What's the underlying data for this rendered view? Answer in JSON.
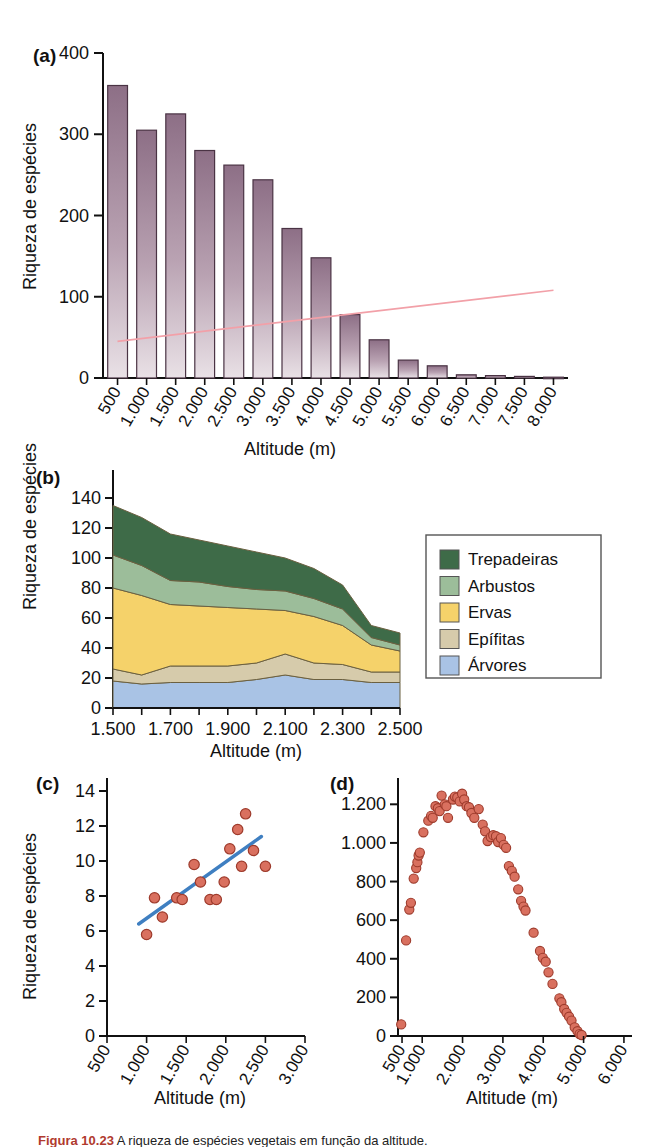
{
  "figure": {
    "caption_label": "Figura 10.23",
    "caption_text": "   A riqueza de espécies vegetais em função da altitude.",
    "shared_y_label": "Riqueza de espécies",
    "shared_x_label": "Altitude (m)"
  },
  "panels": {
    "a": {
      "tag": "(a)",
      "ylabel": "Riqueza de espécies",
      "xlabel": "Altitude (m)",
      "ylim": [
        0,
        400
      ],
      "yticks": [
        "0",
        "100",
        "200",
        "300",
        "400"
      ]
    },
    "b": {
      "tag": "(b)",
      "ylabel": "Riqueza de espécies",
      "xlabel": "Altitude (m)",
      "ylim": [
        0,
        140
      ],
      "yticks": [
        "0",
        "20",
        "40",
        "60",
        "80",
        "100",
        "120",
        "140"
      ]
    },
    "c": {
      "tag": "(c)",
      "ylabel": "Riqueza de espécies",
      "xlabel": "Altitude (m)",
      "ylim": [
        0,
        14
      ],
      "yticks": [
        "0",
        "2",
        "4",
        "6",
        "8",
        "10",
        "12",
        "14"
      ]
    },
    "d": {
      "tag": "(d)",
      "ylabel": "",
      "xlabel": "Altitude (m)",
      "ylim": [
        0,
        1300
      ],
      "yticks": [
        "0",
        "200",
        "400",
        "600",
        "800",
        "1.000",
        "1.200"
      ]
    }
  },
  "colors": {
    "bar_top": "#8d6f86",
    "bar_bottom": "#e6dde3",
    "bar_stroke": "#4a3344",
    "trend_pink": "#f2a0a8",
    "trend_blue": "#3f7fc1",
    "point_fill": "#d9705f",
    "point_stroke": "#9e3b2c",
    "trepadeiras": "#3e6b48",
    "arbustos": "#9cbd9a",
    "ervas": "#f5d26a",
    "epifitas": "#d6cbab",
    "arvores": "#a9c3e5",
    "axis": "#111111"
  },
  "chart_data": [
    {
      "id": "a",
      "type": "bar",
      "title": "(a)",
      "xlabel": "Altitude (m)",
      "ylabel": "Riqueza de espécies",
      "ylim": [
        0,
        400
      ],
      "yticks": [
        0,
        100,
        200,
        300,
        400
      ],
      "grid": false,
      "categories": [
        "500",
        "1.000",
        "1.500",
        "2.000",
        "2.500",
        "3.000",
        "3.500",
        "4.000",
        "4.500",
        "5.000",
        "5.500",
        "6.000",
        "6.500",
        "7.000",
        "7.500",
        "8.000"
      ],
      "values": [
        360,
        305,
        325,
        280,
        262,
        244,
        184,
        148,
        78,
        47,
        22,
        15,
        4,
        3,
        2,
        1
      ],
      "annotations": [
        {
          "type": "trend-line",
          "color": "#f2a0a8",
          "from": [
            0,
            45
          ],
          "to": [
            15,
            108
          ],
          "note": "faint pink regression line across bars"
        }
      ]
    },
    {
      "id": "b",
      "type": "area",
      "title": "(b)",
      "xlabel": "Altitude (m)",
      "ylabel": "Riqueza de espécies",
      "ylim": [
        0,
        140
      ],
      "yticks": [
        0,
        20,
        40,
        60,
        80,
        100,
        120,
        140
      ],
      "xticks": [
        "1.500",
        "1.700",
        "1.900",
        "2.100",
        "2.300",
        "2.500"
      ],
      "x": [
        1500,
        1600,
        1700,
        1800,
        1900,
        2000,
        2100,
        2200,
        2300,
        2400,
        2500
      ],
      "stacked": true,
      "legend_position": "right",
      "series": [
        {
          "name": "Árvores",
          "color": "#a9c3e5",
          "values": [
            18,
            16,
            17,
            17,
            17,
            19,
            22,
            19,
            19,
            17,
            17
          ]
        },
        {
          "name": "Epífitas",
          "color": "#d6cbab",
          "values": [
            8,
            6,
            11,
            11,
            11,
            11,
            14,
            11,
            10,
            7,
            7
          ]
        },
        {
          "name": "Ervas",
          "color": "#f5d26a",
          "values": [
            54,
            53,
            41,
            40,
            39,
            36,
            29,
            31,
            26,
            18,
            14
          ]
        },
        {
          "name": "Arbustos",
          "color": "#9cbd9a",
          "values": [
            22,
            20,
            16,
            16,
            14,
            13,
            13,
            12,
            11,
            5,
            4
          ]
        },
        {
          "name": "Trepadeiras",
          "color": "#3e6b48",
          "values": [
            33,
            32,
            31,
            28,
            27,
            25,
            22,
            20,
            16,
            8,
            8
          ]
        }
      ],
      "legend": [
        "Trepadeiras",
        "Arbustos",
        "Ervas",
        "Epífitas",
        "Árvores"
      ]
    },
    {
      "id": "c",
      "type": "scatter",
      "title": "(c)",
      "xlabel": "Altitude (m)",
      "ylabel": "Riqueza de espécies",
      "ylim": [
        0,
        14
      ],
      "yticks": [
        0,
        2,
        4,
        6,
        8,
        10,
        12,
        14
      ],
      "xlim": [
        500,
        3000
      ],
      "xticks": [
        "500",
        "1.000",
        "1.500",
        "2.000",
        "2.500",
        "3.000"
      ],
      "points": [
        [
          1000,
          5.8
        ],
        [
          1100,
          7.9
        ],
        [
          1200,
          6.8
        ],
        [
          1380,
          7.9
        ],
        [
          1450,
          7.8
        ],
        [
          1600,
          9.8
        ],
        [
          1680,
          8.8
        ],
        [
          1800,
          7.8
        ],
        [
          1880,
          7.8
        ],
        [
          1980,
          8.8
        ],
        [
          2050,
          10.7
        ],
        [
          2150,
          11.8
        ],
        [
          2250,
          12.7
        ],
        [
          2200,
          9.7
        ],
        [
          2350,
          10.6
        ],
        [
          2500,
          9.7
        ]
      ],
      "trend_line": {
        "color": "#3f7fc1",
        "from": [
          900,
          6.4
        ],
        "to": [
          2450,
          11.4
        ]
      }
    },
    {
      "id": "d",
      "type": "scatter",
      "title": "(d)",
      "xlabel": "Altitude (m)",
      "ylabel": "",
      "ylim": [
        0,
        1300
      ],
      "yticks": [
        0,
        200,
        400,
        600,
        800,
        1000,
        1200
      ],
      "xlim": [
        400,
        6200
      ],
      "xticks": [
        "500",
        "1.000",
        "2.000",
        "3.000",
        "4.000",
        "5.000",
        "6.000"
      ],
      "points": [
        [
          480,
          60
        ],
        [
          600,
          495
        ],
        [
          680,
          655
        ],
        [
          720,
          690
        ],
        [
          790,
          815
        ],
        [
          850,
          870
        ],
        [
          880,
          900
        ],
        [
          910,
          935
        ],
        [
          940,
          950
        ],
        [
          1030,
          1055
        ],
        [
          1150,
          1115
        ],
        [
          1220,
          1140
        ],
        [
          1260,
          1130
        ],
        [
          1330,
          1190
        ],
        [
          1390,
          1180
        ],
        [
          1430,
          1165
        ],
        [
          1480,
          1245
        ],
        [
          1560,
          1200
        ],
        [
          1600,
          1190
        ],
        [
          1640,
          1130
        ],
        [
          1760,
          1225
        ],
        [
          1810,
          1240
        ],
        [
          1870,
          1235
        ],
        [
          1930,
          1215
        ],
        [
          1990,
          1255
        ],
        [
          2040,
          1225
        ],
        [
          2100,
          1190
        ],
        [
          2160,
          1185
        ],
        [
          2220,
          1155
        ],
        [
          2290,
          1130
        ],
        [
          2400,
          1175
        ],
        [
          2500,
          1095
        ],
        [
          2560,
          1060
        ],
        [
          2620,
          1010
        ],
        [
          2700,
          1030
        ],
        [
          2760,
          1040
        ],
        [
          2830,
          1035
        ],
        [
          2880,
          1005
        ],
        [
          2950,
          1025
        ],
        [
          3020,
          990
        ],
        [
          3080,
          975
        ],
        [
          3150,
          880
        ],
        [
          3220,
          855
        ],
        [
          3290,
          825
        ],
        [
          3380,
          760
        ],
        [
          3450,
          700
        ],
        [
          3510,
          670
        ],
        [
          3560,
          650
        ],
        [
          3760,
          535
        ],
        [
          3920,
          440
        ],
        [
          3990,
          405
        ],
        [
          4060,
          385
        ],
        [
          4130,
          330
        ],
        [
          4230,
          270
        ],
        [
          4400,
          195
        ],
        [
          4450,
          175
        ],
        [
          4520,
          140
        ],
        [
          4580,
          120
        ],
        [
          4640,
          100
        ],
        [
          4700,
          80
        ],
        [
          4780,
          45
        ],
        [
          4850,
          25
        ],
        [
          4900,
          10
        ],
        [
          4950,
          5
        ]
      ]
    }
  ]
}
